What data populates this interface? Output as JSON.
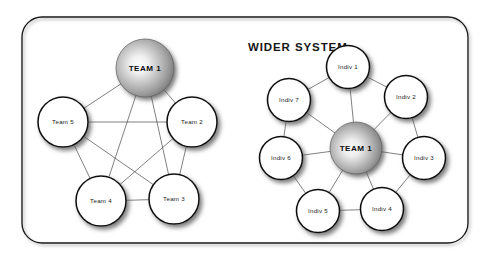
{
  "diagram": {
    "title": "WIDER SYSTEM",
    "background_color": "#ffffff",
    "border_color": "#141414",
    "edge_color": "#3a3a3a",
    "node_fill": "#ffffff",
    "node_stroke": "#111111",
    "hub_gradient_highlight": "#fbfbfb",
    "hub_gradient_mid": "#b5b5b5",
    "hub_gradient_edge": "#6f6f6f",
    "left_cluster": {
      "name": "team-network",
      "hub": {
        "label": "TEAM 1",
        "cx": 145,
        "cy": 68,
        "r": 29
      },
      "nodes": [
        {
          "label": "Team 2",
          "cx": 192,
          "cy": 122,
          "r": 25
        },
        {
          "label": "Team 3",
          "cx": 174,
          "cy": 199,
          "r": 25
        },
        {
          "label": "Team 4",
          "cx": 101,
          "cy": 201,
          "r": 25
        },
        {
          "label": "Team 5",
          "cx": 63,
          "cy": 122,
          "r": 25
        }
      ]
    },
    "right_cluster": {
      "name": "individual-network",
      "hub": {
        "label": "TEAM 1",
        "cx": 356,
        "cy": 148,
        "r": 26
      },
      "nodes": [
        {
          "label": "Indiv 1",
          "cx": 348,
          "cy": 67,
          "r": 21.5
        },
        {
          "label": "Indiv 2",
          "cx": 406,
          "cy": 97,
          "r": 21.5
        },
        {
          "label": "Indiv 3",
          "cx": 424,
          "cy": 158,
          "r": 21.5
        },
        {
          "label": "Indiv 4",
          "cx": 382,
          "cy": 209,
          "r": 21.5
        },
        {
          "label": "Indiv 5",
          "cx": 318,
          "cy": 211,
          "r": 21.5
        },
        {
          "label": "Indiv 6",
          "cx": 281,
          "cy": 158,
          "r": 21.5
        },
        {
          "label": "Indiv 7",
          "cx": 289,
          "cy": 100,
          "r": 21.5
        }
      ]
    },
    "frame": {
      "x": 22,
      "y": 17,
      "width": 446,
      "height": 226,
      "radius": 20
    }
  }
}
